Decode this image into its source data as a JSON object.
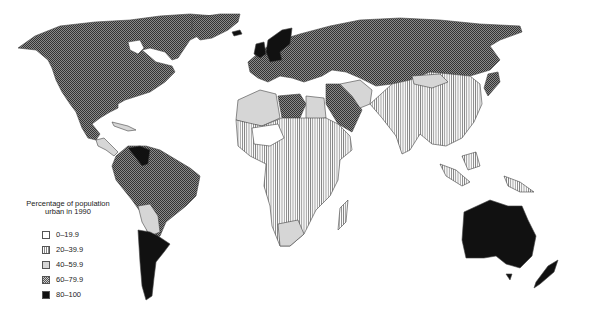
{
  "map": {
    "title": "Percentage of population urban in 1990",
    "legend": {
      "title_line1": "Percentage of population",
      "title_line2": "urban in 1990",
      "items": [
        {
          "label": "0–19.9",
          "fill": "white"
        },
        {
          "label": "20–39.9",
          "fill": "vertical-hatch"
        },
        {
          "label": "40–59.9",
          "fill": "light-grey"
        },
        {
          "label": "60–79.9",
          "fill": "dark-crosshatch"
        },
        {
          "label": "80–100",
          "fill": "black"
        }
      ]
    },
    "colors": {
      "white": "#ffffff",
      "hatch": "#888888",
      "light_grey": "#d6d6d6",
      "crosshatch": "#555555",
      "black": "#111111"
    },
    "regions": [
      {
        "name": "North America (USA, Canada)",
        "class": "60–79.9"
      },
      {
        "name": "Greenland",
        "class": "60–79.9"
      },
      {
        "name": "Mexico",
        "class": "60–79.9"
      },
      {
        "name": "Central America",
        "class": "40–59.9"
      },
      {
        "name": "Venezuela",
        "class": "80–100"
      },
      {
        "name": "Brazil / Colombia / Peru",
        "class": "60–79.9"
      },
      {
        "name": "Bolivia / Paraguay",
        "class": "40–59.9"
      },
      {
        "name": "Argentina / Chile / Uruguay",
        "class": "80–100"
      },
      {
        "name": "UK / Germany / Scandinavia",
        "class": "80–100"
      },
      {
        "name": "Europe / USSR",
        "class": "60–79.9"
      },
      {
        "name": "Libya / Arabia / Turkey",
        "class": "60–79.9"
      },
      {
        "name": "North-west Africa / Egypt / Iran",
        "class": "40–59.9"
      },
      {
        "name": "Sub-Saharan Africa",
        "class": "20–39.9"
      },
      {
        "name": "Sahel",
        "class": "0–19.9"
      },
      {
        "name": "South Africa",
        "class": "40–59.9"
      },
      {
        "name": "China / India / South-east Asia",
        "class": "20–39.9"
      },
      {
        "name": "Mongolia / Korea",
        "class": "40–59.9"
      },
      {
        "name": "Japan",
        "class": "60–79.9"
      },
      {
        "name": "Australia / New Zealand",
        "class": "80–100"
      }
    ]
  }
}
